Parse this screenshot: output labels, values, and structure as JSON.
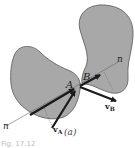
{
  "figure": {
    "panel_label": "(a)",
    "caption": "Fig. 17.12",
    "colors": {
      "body_fill": "#a8a8a8",
      "body_stroke": "#555555",
      "arrow": "#1a1a1a",
      "line": "#666666"
    },
    "bodies": [
      {
        "name": "left-body",
        "point_label": "A",
        "velocity_label": "v",
        "velocity_sub": "A"
      },
      {
        "name": "right-body",
        "point_label": "B",
        "velocity_label": "v",
        "velocity_sub": "B"
      }
    ],
    "normal_line": {
      "label_start": "n",
      "label_end": "n"
    }
  }
}
